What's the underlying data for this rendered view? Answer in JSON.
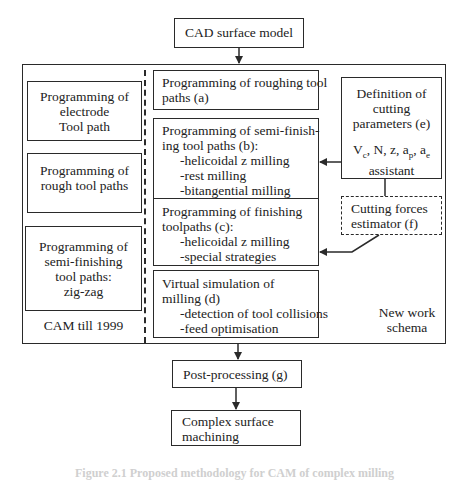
{
  "diagram": {
    "top_node": {
      "label": "CAD surface model"
    },
    "outer_region": {
      "old_schema": {
        "label": "CAM till 1999",
        "boxes": [
          {
            "lines": [
              "Programming of",
              "electrode",
              "Tool path"
            ]
          },
          {
            "lines": [
              "Programming of",
              "rough tool paths"
            ]
          },
          {
            "lines": [
              "Programming of",
              "semi-finishing",
              "tool paths:",
              "zig-zag"
            ]
          }
        ]
      },
      "new_schema": {
        "label_lines": [
          "New work",
          "schema"
        ],
        "steps": [
          {
            "id": "a",
            "lines": [
              "Programming of roughing tool",
              "paths (a)"
            ],
            "bullets": []
          },
          {
            "id": "b",
            "lines": [
              "Programming of semi-finish-",
              "ing tool paths (b):"
            ],
            "bullets": [
              "-helicoidal z milling",
              "-rest milling",
              "-bitangential milling"
            ]
          },
          {
            "id": "c",
            "lines": [
              "Programming of finishing",
              "toolpaths (c):"
            ],
            "bullets": [
              "-helicoidal z milling",
              "-special strategies"
            ]
          },
          {
            "id": "d",
            "lines": [
              "Virtual simulation of",
              "milling (d)"
            ],
            "bullets": [
              "-detection of tool collisions",
              "-feed optimisation"
            ]
          }
        ],
        "cutting_parameters": {
          "id": "e",
          "lines": [
            "Definition of",
            "cutting",
            "parameters (e)"
          ],
          "symbols": {
            "vc": "V",
            "vc_sub": "c",
            "rest1": ", N, z, a",
            "ap_sub": "p",
            "rest2": ", a",
            "ae_sub": "e"
          },
          "assistant": "assistant"
        },
        "cutting_forces": {
          "id": "f",
          "lines": [
            "Cutting forces",
            "estimator (f)"
          ]
        }
      }
    },
    "post_processing": {
      "label": "Post-processing (g)"
    },
    "final_node": {
      "lines": [
        "Complex surface",
        "machining"
      ]
    },
    "caption": "Figure 2.1 Proposed methodology for CAM of complex milling"
  },
  "colors": {
    "stroke": "#2a2a2a",
    "background": "#ffffff",
    "text": "#222222"
  }
}
